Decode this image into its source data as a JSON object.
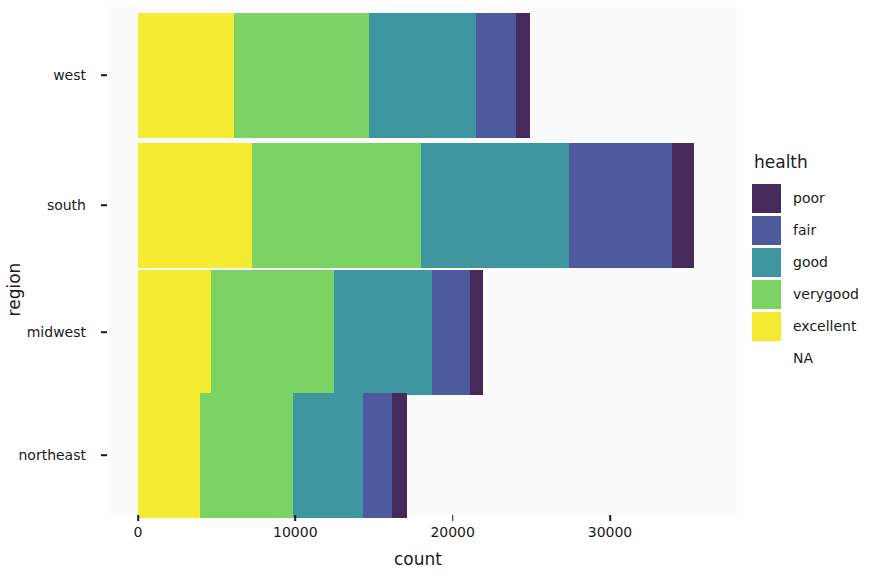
{
  "chart_data": {
    "type": "bar",
    "orientation": "horizontal",
    "stacked": true,
    "title": "",
    "xlabel": "count",
    "ylabel": "region",
    "categories": [
      "northeast",
      "midwest",
      "south",
      "west"
    ],
    "category_order_top_to_bottom": [
      "west",
      "south",
      "midwest",
      "northeast"
    ],
    "xlim": [
      0,
      35800
    ],
    "xticks": [
      0,
      10000,
      20000,
      30000
    ],
    "xtick_labels": [
      "0",
      "10000",
      "20000",
      "30000"
    ],
    "grid": false,
    "legend": {
      "title": "health",
      "position": "right",
      "entries": [
        {
          "label": "poor",
          "color": "#472A5C"
        },
        {
          "label": "fair",
          "color": "#4E5A9E"
        },
        {
          "label": "good",
          "color": "#3E96A0"
        },
        {
          "label": "verygood",
          "color": "#7BD364"
        },
        {
          "label": "excellent",
          "color": "#F5EB30"
        },
        {
          "label": "NA",
          "color": "transparent"
        }
      ]
    },
    "series": [
      {
        "name": "excellent",
        "color": "#F5EB30",
        "values": [
          3950,
          4650,
          7250,
          6100
        ]
      },
      {
        "name": "verygood",
        "color": "#7BD364",
        "values": [
          5900,
          7800,
          10750,
          8600
        ]
      },
      {
        "name": "good",
        "color": "#3E96A0",
        "values": [
          4450,
          6250,
          9400,
          6800
        ]
      },
      {
        "name": "fair",
        "color": "#4E5A9E",
        "values": [
          1850,
          2400,
          6550,
          2500
        ]
      },
      {
        "name": "poor",
        "color": "#472A5C",
        "values": [
          950,
          850,
          1400,
          900
        ]
      }
    ],
    "totals": [
      17100,
      21950,
      35350,
      24900
    ],
    "stack_order_left_to_right": [
      "excellent",
      "verygood",
      "good",
      "fair",
      "poor"
    ]
  },
  "axes": {
    "y_title": "region",
    "x_title": "count",
    "y_tick_labels": [
      "west",
      "south",
      "midwest",
      "northeast"
    ],
    "x_tick_labels": [
      "0",
      "10000",
      "20000",
      "30000"
    ]
  },
  "colors": {
    "panel_background": "#fbfbfb",
    "page_background": "#ffffff",
    "text": "#1a1a1a"
  }
}
